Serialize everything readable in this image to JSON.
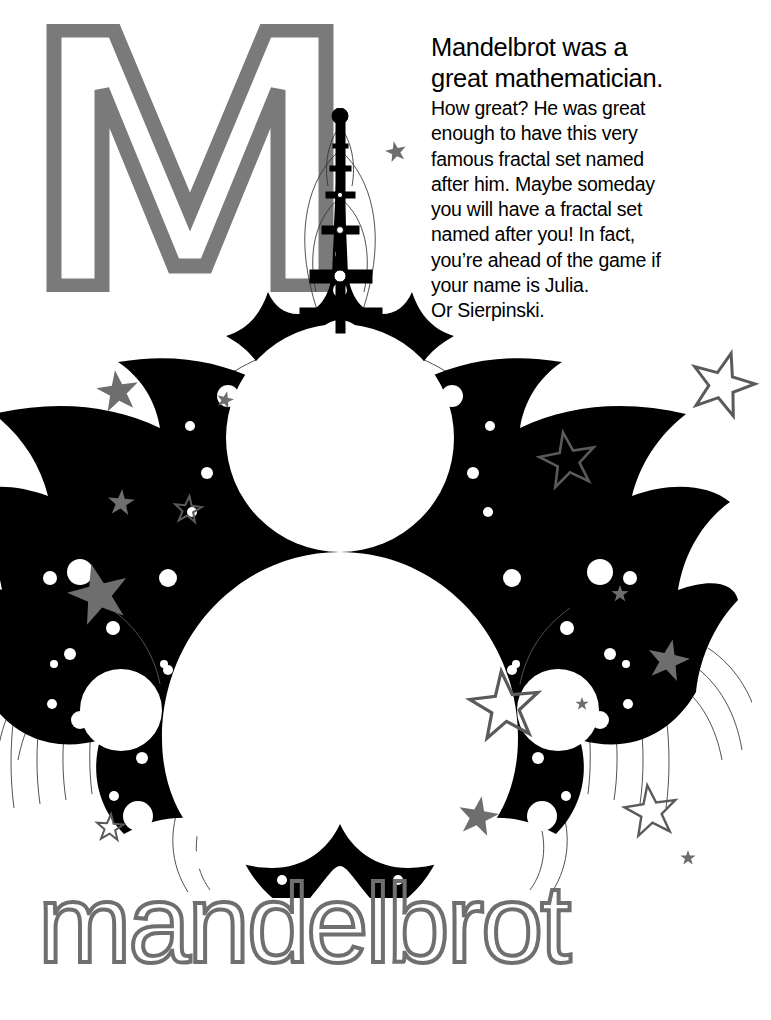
{
  "page": {
    "title": "Mandelbrot",
    "background_color": "#ffffff",
    "width": 771,
    "height": 1020
  },
  "letter": {
    "glyph": "M",
    "style": "outline",
    "color": "#7a7a7a"
  },
  "copy": {
    "headline": "Mandelbrot was a\ngreat mathematician.",
    "body": "How great? He was great\nenough to have this very\nfamous fractal set named\nafter him. Maybe someday\nyou will have a fractal set\nnamed after you! In fact,\nyou’re ahead of the game if\nyour name is Julia.\nOr Sierpinski.",
    "text_color": "#000000"
  },
  "wordmark": {
    "text": "mandelbrot",
    "style": "outline",
    "color": "#6f6f6f"
  },
  "fractal": {
    "name": "mandelbrot-set",
    "orientation": "rotated-90-pointing-up",
    "fill_color": "#000000",
    "contour_color": "#2b2b2b",
    "hole_color": "#ffffff",
    "description": "Mandelbrot set rendered with cardioid and period-2 bulb as large white discs, black boundary detail, escape-time contour curves and white mini-bulb holes."
  },
  "stars": {
    "filled_color": "#6e6e6e",
    "outline_color": "#5a5a5a",
    "items": [
      {
        "name": "star-filled-top-right-text",
        "x": 396,
        "y": 152,
        "r": 11,
        "fill": true,
        "rot": -12
      },
      {
        "name": "star-filled-left-upper",
        "x": 118,
        "y": 392,
        "r": 22,
        "fill": true,
        "rot": -8
      },
      {
        "name": "star-filled-mid-left-small",
        "x": 225,
        "y": 400,
        "r": 9,
        "fill": true,
        "rot": 14
      },
      {
        "name": "star-outline-right-big",
        "x": 722,
        "y": 385,
        "r": 33,
        "fill": false,
        "rot": 16
      },
      {
        "name": "star-outline-right-mid",
        "x": 568,
        "y": 461,
        "r": 29,
        "fill": false,
        "rot": -10
      },
      {
        "name": "star-filled-left-small",
        "x": 121,
        "y": 503,
        "r": 14,
        "fill": true,
        "rot": 5
      },
      {
        "name": "star-outline-left-small",
        "x": 188,
        "y": 510,
        "r": 14,
        "fill": false,
        "rot": 6
      },
      {
        "name": "star-filled-left-large",
        "x": 99,
        "y": 595,
        "r": 32,
        "fill": true,
        "rot": -14
      },
      {
        "name": "star-filled-right-tiny",
        "x": 620,
        "y": 594,
        "r": 9,
        "fill": true,
        "rot": 0
      },
      {
        "name": "star-filled-right-mid",
        "x": 668,
        "y": 661,
        "r": 22,
        "fill": true,
        "rot": 12
      },
      {
        "name": "star-outline-center-big",
        "x": 505,
        "y": 707,
        "r": 36,
        "fill": false,
        "rot": -6
      },
      {
        "name": "star-filled-inside-disc-tiny",
        "x": 582,
        "y": 704,
        "r": 7,
        "fill": true,
        "rot": 0
      },
      {
        "name": "star-outline-right-lower",
        "x": 651,
        "y": 812,
        "r": 27,
        "fill": false,
        "rot": -8
      },
      {
        "name": "star-filled-bottom-center",
        "x": 478,
        "y": 817,
        "r": 21,
        "fill": true,
        "rot": 10
      },
      {
        "name": "star-outline-bottom-left",
        "x": 110,
        "y": 828,
        "r": 14,
        "fill": false,
        "rot": 4
      },
      {
        "name": "star-filled-bottom-right-tiny",
        "x": 688,
        "y": 858,
        "r": 8,
        "fill": true,
        "rot": 0
      }
    ]
  }
}
